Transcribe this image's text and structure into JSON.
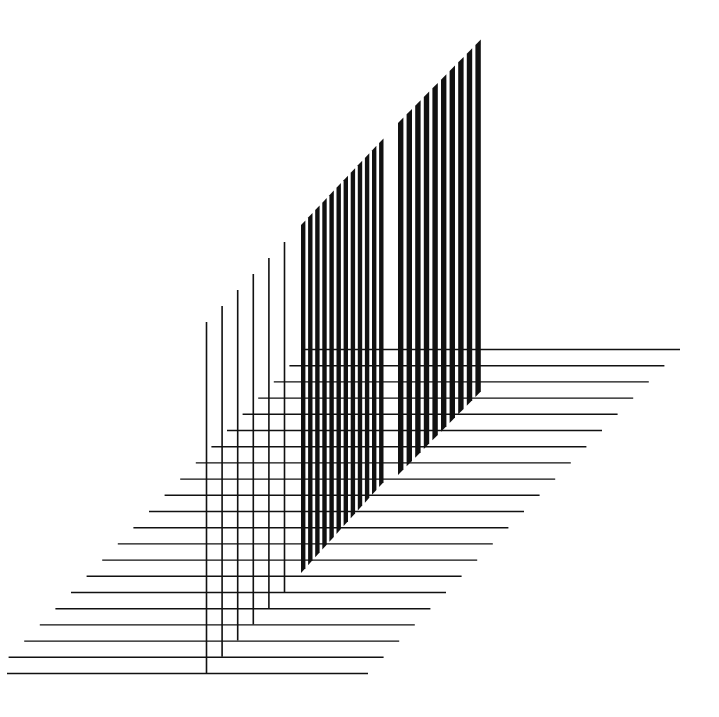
{
  "artwork": {
    "background": "#ffffff",
    "ink": "#111111",
    "horizontals": {
      "count": 21,
      "top_y": 349.5,
      "spacing": 16.2,
      "top_right_x": 680,
      "top_left_x": 305,
      "step_x": -15.6,
      "min_left_x": 7,
      "stroke": 1.4
    },
    "thin_verticals": {
      "count": 6,
      "x_start": 206.5,
      "x_step": 15.6,
      "top_y_start": 322,
      "top_y_step": -16,
      "bottom_y_start": 673,
      "bottom_y_step": -16.2,
      "stroke": 1.6
    },
    "bars_left": {
      "count": 12,
      "x_start": 301,
      "x_step": 7.1,
      "width": 4.4,
      "top_y_start": 225,
      "top_y_end": 143,
      "bottom_y_start": 573,
      "bottom_y_end": 487
    },
    "bars_right": {
      "count": 10,
      "x_start": 398,
      "x_step": 8.6,
      "width": 5.4,
      "top_y_start": 123,
      "top_y_end": 45,
      "bottom_y_start": 475,
      "bottom_y_end": 397
    }
  }
}
